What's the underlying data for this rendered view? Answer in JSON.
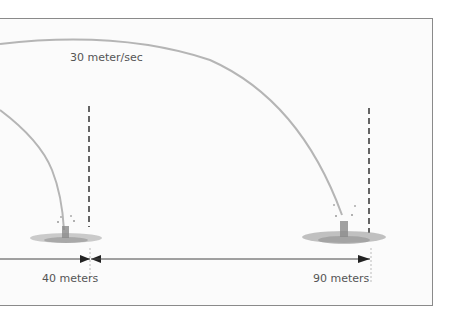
{
  "diagram": {
    "speed_label": "30 meter/sec",
    "distance_labels": [
      "40 meters",
      "90 meters"
    ],
    "colors": {
      "frame": "#8a8a8a",
      "trajectory": "#b5b5b5",
      "dashed_marker": "#333333",
      "arrow": "#222222",
      "text": "#555555",
      "splash": "#9a9a9a"
    }
  }
}
